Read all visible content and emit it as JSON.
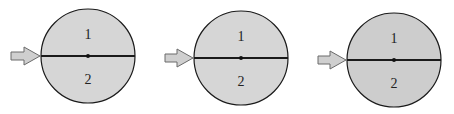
{
  "diagrams": [
    {
      "id": "panel-1",
      "center": [
        88,
        56
      ],
      "radius": 47,
      "fill": "#d6d6d6",
      "region_labels": {
        "top": "1",
        "bottom": "2"
      }
    },
    {
      "id": "panel-2",
      "center": [
        241,
        58
      ],
      "radius": 47,
      "fill": "#d6d6d6",
      "region_labels": {
        "top": "1",
        "bottom": "2"
      }
    },
    {
      "id": "panel-3",
      "center": [
        394,
        60
      ],
      "radius": 47,
      "fill": "#cdcdcd",
      "region_labels": {
        "top": "1",
        "bottom": "2"
      }
    }
  ],
  "colors": {
    "outline": "#1a1a1a",
    "arrow_fill": "#cfcfcf",
    "arrow_stroke": "#6a6a6a"
  }
}
